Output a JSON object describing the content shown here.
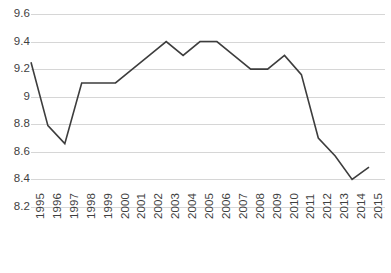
{
  "chart_data": {
    "type": "line",
    "title": "",
    "subtitle": "",
    "xlabel": "",
    "ylabel": "",
    "categories": [
      "1995",
      "1996",
      "1997",
      "1998",
      "1999",
      "2000",
      "2001",
      "2002",
      "2003",
      "2004",
      "2005",
      "2006",
      "2007",
      "2008",
      "2009",
      "2010",
      "2011",
      "2012",
      "2013",
      "2014",
      "2015"
    ],
    "values": [
      9.25,
      8.79,
      8.66,
      9.1,
      9.1,
      9.1,
      9.2,
      9.3,
      9.4,
      9.3,
      9.4,
      9.4,
      9.3,
      9.2,
      9.2,
      9.3,
      9.16,
      8.7,
      9.57,
      8.4,
      8.49
    ],
    "series": [
      {
        "name": "series-1",
        "values": [
          9.25,
          8.79,
          8.66,
          9.1,
          9.1,
          9.1,
          9.2,
          9.3,
          9.4,
          9.3,
          9.4,
          9.4,
          9.3,
          9.2,
          9.2,
          9.3,
          9.16,
          8.7,
          8.57,
          8.4,
          8.49
        ],
        "color": "#3d3d3d"
      }
    ],
    "ylim": [
      8.2,
      9.6
    ],
    "yticks": [
      8.2,
      8.4,
      8.6,
      8.8,
      9.0,
      9.2,
      9.4,
      9.6
    ],
    "ytick_labels": [
      "8.2",
      "8.4",
      "8.6",
      "8.8",
      "9",
      "9.2",
      "9.4",
      "9.6"
    ],
    "grid": true,
    "grid_color": "#d6d6d6",
    "legend": false,
    "legend_position": "none",
    "line_color": "#3d3d3d",
    "background": "#ffffff",
    "xtick_rotation": -90
  }
}
